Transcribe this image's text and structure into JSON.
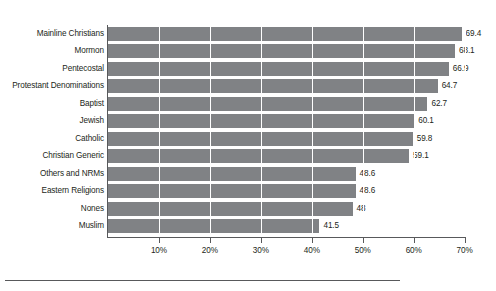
{
  "chart_data": {
    "type": "bar",
    "orientation": "horizontal",
    "title": "",
    "subtitle": "",
    "xlabel": "",
    "ylabel": "",
    "xlim": [
      0,
      70
    ],
    "grid": true,
    "legend": null,
    "bar_color": "#808285",
    "axis_color": "#58595b",
    "categories": [
      "Mainline Christians",
      "Mormon",
      "Pentecostal",
      "Protestant Denominations",
      "Baptist",
      "Jewish",
      "Catholic",
      "Christian Generic",
      "Others and NRMs",
      "Eastern Religions",
      "Nones",
      "Muslim"
    ],
    "values": [
      69.4,
      68.1,
      66.9,
      64.7,
      62.7,
      60.1,
      59.8,
      59.1,
      48.6,
      48.6,
      48,
      41.5
    ],
    "value_labels": [
      "69.4",
      "68.1",
      "66.9",
      "64.7",
      "62.7",
      "60.1",
      "59.8",
      "59.1",
      "48.6",
      "48.6",
      "48",
      "41.5"
    ],
    "xticks": [
      10,
      20,
      30,
      40,
      50,
      60,
      70
    ],
    "xtick_labels": [
      "10%",
      "20%",
      "30%",
      "40%",
      "50%",
      "60%",
      "70%"
    ]
  }
}
